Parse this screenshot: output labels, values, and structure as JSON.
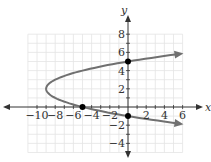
{
  "chart_data": {
    "type": "line",
    "title": "",
    "xlabel": "x",
    "ylabel": "y",
    "xlim": [
      -11,
      6
    ],
    "ylim": [
      -5,
      8
    ],
    "grid": true,
    "x_ticks": [
      "-10",
      "-8",
      "-6",
      "-4",
      "-2",
      "2",
      "4",
      "6"
    ],
    "y_ticks": [
      "8",
      "6",
      "4",
      "2",
      "-2",
      "-4"
    ],
    "series": [
      {
        "name": "x = (y - 2)^2 - 9",
        "color": "#707070",
        "vertex": [
          -9,
          2
        ]
      }
    ],
    "points": [
      [
        0,
        5
      ],
      [
        0,
        -1
      ],
      [
        -5,
        0
      ]
    ]
  }
}
